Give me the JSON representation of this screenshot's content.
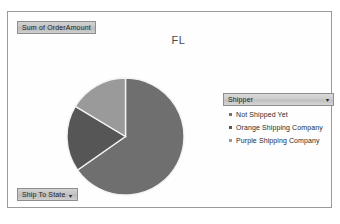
{
  "window": {
    "frame_border_color": "#9a9a9a",
    "background_color": "#fefefe"
  },
  "data_field_button": {
    "label": "Sum of OrderAmount",
    "name": "sum-of-orderamount"
  },
  "row_field_button": {
    "label": "Ship To State",
    "arrow": "▾",
    "name": "ship-to-state"
  },
  "chart": {
    "title": "FL"
  },
  "legend": {
    "field_label": "Shipper",
    "arrow": "▾",
    "entries": [
      {
        "label": "Not Shipped Yet",
        "marker": "▪",
        "color": "#6f6f6f"
      },
      {
        "label": "Orange Shipping Company",
        "marker": "▪",
        "color": "#565656"
      },
      {
        "label": "Purple Shipping Company",
        "marker": "▪",
        "color": "#9a9a9a"
      }
    ]
  },
  "chart_data": {
    "type": "pie",
    "title": "FL",
    "value_field": "Sum of OrderAmount",
    "category_field": "Shipper",
    "categories": [
      "Not Shipped Yet",
      "Orange Shipping Company",
      "Purple Shipping Company"
    ],
    "values": [
      65.3,
      18.3,
      16.4
    ],
    "units": "percent of total",
    "slice_angles_deg": [
      235,
      66,
      59
    ],
    "colors": [
      "#6f6f6f",
      "#565656",
      "#9a9a9a"
    ],
    "slice_border_color": "#f2f2f2",
    "start_angle_deg": 0,
    "direction": "clockwise",
    "legend_position": "right",
    "data_labels": false,
    "grid": false
  },
  "caption": {
    "text": ""
  }
}
